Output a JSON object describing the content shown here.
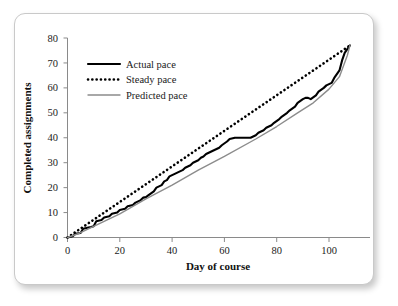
{
  "figure": {
    "background_color": "#ffffff",
    "border_color": "#c9c9c9"
  },
  "chart_data": {
    "type": "line",
    "title": "",
    "xlabel": "Day of course",
    "ylabel": "Completed assignments",
    "xlim": [
      0,
      113
    ],
    "ylim": [
      0,
      80
    ],
    "xticks": [
      0,
      20,
      40,
      60,
      80,
      100
    ],
    "yticks": [
      0,
      10,
      20,
      30,
      40,
      50,
      60,
      70,
      80
    ],
    "grid": false,
    "legend_position": "upper left",
    "series": [
      {
        "name": "Actual pace",
        "color": "#000000",
        "style": "solid",
        "width": 2.1,
        "x": [
          0,
          2,
          3,
          5,
          6,
          8,
          9,
          10,
          11,
          13,
          14,
          16,
          17,
          19,
          20,
          22,
          23,
          25,
          26,
          28,
          29,
          30,
          31,
          33,
          34,
          36,
          37,
          38,
          39,
          41,
          42,
          44,
          45,
          47,
          48,
          50,
          51,
          52,
          53,
          55,
          56,
          58,
          59,
          61,
          62,
          64,
          65,
          67,
          68,
          70,
          71,
          72,
          73,
          75,
          76,
          78,
          79,
          81,
          82,
          84,
          85,
          87,
          88,
          90,
          91,
          92,
          93,
          95,
          96,
          98,
          99,
          101,
          102,
          104,
          105,
          106,
          107,
          108
        ],
        "y": [
          0,
          0.5,
          1.5,
          1.8,
          3.5,
          4,
          4.2,
          4.5,
          6.5,
          7,
          8,
          8.5,
          9.5,
          10,
          11,
          11.5,
          12.5,
          13,
          14,
          15,
          16,
          16.2,
          17,
          18.5,
          20,
          21,
          22.5,
          23,
          24.5,
          25.5,
          26,
          27,
          28,
          29,
          30,
          31,
          32,
          32.5,
          33.5,
          34.5,
          35,
          36,
          37,
          38.5,
          39.5,
          40,
          40,
          40,
          40,
          40,
          40.5,
          41,
          42,
          43,
          44,
          45,
          46,
          47.5,
          48.5,
          50,
          51,
          52.5,
          54,
          55.5,
          56,
          56,
          55.5,
          57,
          58.5,
          60,
          61,
          62,
          64,
          67,
          71,
          74,
          75.5,
          77
        ]
      },
      {
        "name": "Steady pace",
        "color": "#000000",
        "style": "dotted",
        "width": 2.3,
        "x": [
          0,
          108
        ],
        "y": [
          0,
          77
        ]
      },
      {
        "name": "Predicted pace",
        "color": "#8c8c8c",
        "style": "solid",
        "width": 1.4,
        "x": [
          0,
          4,
          10,
          20,
          30,
          40,
          50,
          60,
          72,
          80,
          88,
          94,
          100,
          104,
          107,
          108
        ],
        "y": [
          0,
          1.5,
          4.5,
          9.5,
          15.5,
          21,
          27,
          32.5,
          39.5,
          44.5,
          50,
          54,
          59.5,
          64.5,
          73,
          77
        ]
      }
    ]
  },
  "legend": {
    "items": [
      {
        "label": "Actual pace",
        "marker": "solid-thick-black"
      },
      {
        "label": "Steady pace",
        "marker": "dotted-black"
      },
      {
        "label": "Predicted pace",
        "marker": "solid-thin-gray"
      }
    ]
  }
}
